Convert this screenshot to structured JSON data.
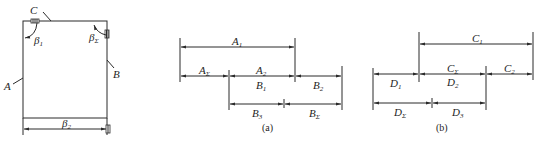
{
  "figure_left": {
    "labels": {
      "A": "A",
      "B": "B",
      "C": "C",
      "beta1": {
        "base": "β",
        "sub": "1"
      },
      "betaSigma": {
        "base": "β",
        "sub": "Σ"
      },
      "beta2": {
        "base": "β",
        "sub": "2"
      }
    }
  },
  "figure_a": {
    "caption": "(a)",
    "dims": {
      "A1": {
        "base": "A",
        "sub": "1"
      },
      "ASigma": {
        "base": "A",
        "sub": "Σ"
      },
      "A2": {
        "base": "A",
        "sub": "2"
      },
      "B1": {
        "base": "B",
        "sub": "1"
      },
      "B2": {
        "base": "B",
        "sub": "2"
      },
      "B3": {
        "base": "B",
        "sub": "3"
      },
      "BSigma": {
        "base": "B",
        "sub": "Σ"
      }
    }
  },
  "figure_b": {
    "caption": "(b)",
    "dims": {
      "C1": {
        "base": "C",
        "sub": "1"
      },
      "CSigma": {
        "base": "C",
        "sub": "Σ"
      },
      "C2": {
        "base": "C",
        "sub": "2"
      },
      "D1": {
        "base": "D",
        "sub": "1"
      },
      "D2": {
        "base": "D",
        "sub": "2"
      },
      "DSigma": {
        "base": "D",
        "sub": "Σ"
      },
      "D3": {
        "base": "D",
        "sub": "3"
      }
    }
  }
}
